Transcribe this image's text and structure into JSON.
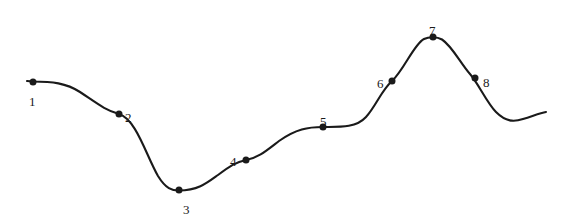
{
  "figure": {
    "background_color": "#ffffff",
    "stroke_color": "#1a1a1a",
    "marker_color": "#1a1a1a",
    "label_color": "#1a1a1a",
    "width": 568,
    "height": 219
  },
  "chart_data": {
    "type": "line",
    "title": "",
    "subtitle": "",
    "xlabel": "",
    "ylabel": "",
    "xlim": [
      0,
      568
    ],
    "ylim": [
      219,
      0
    ],
    "grid": false,
    "legend": null,
    "axes_visible": false,
    "tick_labels": {
      "x": [],
      "y": []
    },
    "annotations": [
      {
        "text": "1",
        "x": 33,
        "y": 82
      },
      {
        "text": "2",
        "x": 119,
        "y": 114
      },
      {
        "text": "3",
        "x": 179,
        "y": 190
      },
      {
        "text": "4",
        "x": 246,
        "y": 160
      },
      {
        "text": "5",
        "x": 323,
        "y": 127
      },
      {
        "text": "6",
        "x": 392,
        "y": 81
      },
      {
        "text": "7",
        "x": 433,
        "y": 37
      },
      {
        "text": "8",
        "x": 475,
        "y": 78
      }
    ],
    "series": [
      {
        "name": "curve",
        "marker": "filled-circle",
        "marker_size": 7,
        "line_width": 2.1,
        "points": [
          {
            "label": "1",
            "x": 33,
            "y": 82,
            "label_dx": -4,
            "label_dy": 13
          },
          {
            "label": "2",
            "x": 119,
            "y": 114,
            "label_dx": 6,
            "label_dy": -3
          },
          {
            "label": "3",
            "x": 179,
            "y": 190,
            "label_dx": 4,
            "label_dy": 13
          },
          {
            "label": "4",
            "x": 246,
            "y": 160,
            "label_dx": -16,
            "label_dy": -5
          },
          {
            "label": "5",
            "x": 323,
            "y": 127,
            "label_dx": -3,
            "label_dy": -12
          },
          {
            "label": "6",
            "x": 392,
            "y": 81,
            "label_dx": -15,
            "label_dy": -4
          },
          {
            "label": "7",
            "x": 433,
            "y": 37,
            "label_dx": -4,
            "label_dy": -13
          },
          {
            "label": "8",
            "x": 475,
            "y": 78,
            "label_dx": 8,
            "label_dy": -2
          }
        ],
        "path": "M 27 81 L 33 81.5 C 52 81.5 66 83 80 92 C 98 104 105 110 119 114 C 136 119 146 155 158 176 C 166 189 172 190.5 179 190.5 C 198 190.5 207 183 218 175 C 230 166 236 162 246 160 C 258 158 266 151 279 141 C 296 129 308 127 323 127 C 340 127 356 128 366 117 C 376 106 381 91 392 81 C 404 70 414 44 424 39 C 429 36.5 437 36.5 442 39.5 C 452 46 461 64 470 74 C 478 83 487 103 496 112 C 506 122 514 122 523 119 C 533 116 540 113 546 112"
      }
    ],
    "end_caps": {
      "start": {
        "x": 27,
        "y": 81
      },
      "end": {
        "x": 546,
        "y": 112
      }
    }
  }
}
